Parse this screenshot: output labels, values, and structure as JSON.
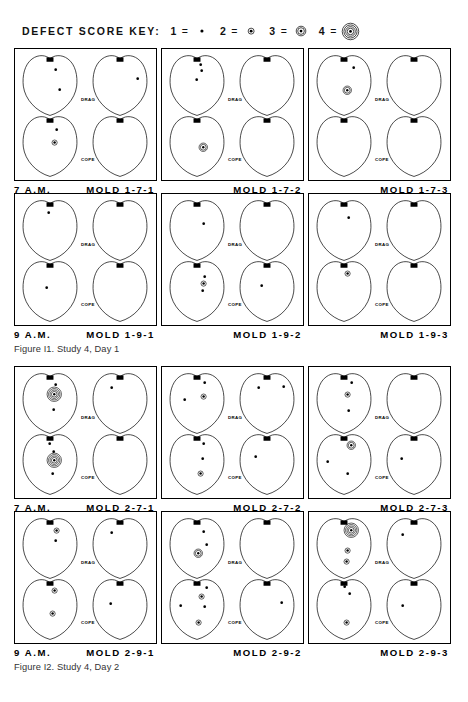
{
  "key": {
    "title": "DEFECT SCORE KEY:",
    "eq": "=",
    "items": [
      {
        "score": "1",
        "mark": 1,
        "name": "score-1-dot"
      },
      {
        "score": "2",
        "mark": 2,
        "name": "score-2-ring"
      },
      {
        "score": "3",
        "mark": 3,
        "name": "score-3-ring"
      },
      {
        "score": "4",
        "mark": 4,
        "name": "score-4-ring"
      }
    ]
  },
  "labels": {
    "drag": "DRAG",
    "cope": "COPE"
  },
  "figures": [
    {
      "caption": "Figure I1.  Study 4, Day 1",
      "rows": [
        {
          "time": "7 A.M.",
          "panels": [
            {
              "label": "MOLD 1-7-1",
              "cells": [
                {
                  "pos": "drag-left",
                  "marks": [
                    {
                      "x": 0.6,
                      "y": 0.26,
                      "s": 1
                    },
                    {
                      "x": 0.66,
                      "y": 0.57,
                      "s": 1
                    }
                  ]
                },
                {
                  "pos": "drag-right",
                  "marks": [
                    {
                      "x": 0.8,
                      "y": 0.4,
                      "s": 1
                    }
                  ]
                },
                {
                  "pos": "cope-left",
                  "marks": [
                    {
                      "x": 0.62,
                      "y": 0.24,
                      "s": 1
                    },
                    {
                      "x": 0.58,
                      "y": 0.45,
                      "s": 2
                    }
                  ]
                },
                {
                  "pos": "cope-right",
                  "marks": []
                }
              ]
            },
            {
              "label": "MOLD 1-7-2",
              "cells": [
                {
                  "pos": "drag-left",
                  "marks": [
                    {
                      "x": 0.56,
                      "y": 0.17,
                      "s": 1
                    },
                    {
                      "x": 0.58,
                      "y": 0.27,
                      "s": 1
                    },
                    {
                      "x": 0.5,
                      "y": 0.42,
                      "s": 1
                    }
                  ]
                },
                {
                  "pos": "drag-right",
                  "marks": []
                },
                {
                  "pos": "cope-left",
                  "marks": [
                    {
                      "x": 0.6,
                      "y": 0.52,
                      "s": 3
                    }
                  ]
                },
                {
                  "pos": "cope-right",
                  "marks": []
                }
              ]
            },
            {
              "label": "MOLD 1-7-3",
              "cells": [
                {
                  "pos": "drag-left",
                  "marks": [
                    {
                      "x": 0.66,
                      "y": 0.22,
                      "s": 1
                    },
                    {
                      "x": 0.56,
                      "y": 0.58,
                      "s": 3
                    }
                  ]
                },
                {
                  "pos": "drag-right",
                  "marks": []
                },
                {
                  "pos": "cope-left",
                  "marks": []
                },
                {
                  "pos": "cope-right",
                  "marks": []
                }
              ]
            }
          ]
        },
        {
          "time": "9 A.M.",
          "panels": [
            {
              "label": "MOLD 1-9-1",
              "cells": [
                {
                  "pos": "drag-left",
                  "marks": [
                    {
                      "x": 0.48,
                      "y": 0.22,
                      "s": 1
                    }
                  ]
                },
                {
                  "pos": "drag-right",
                  "marks": []
                },
                {
                  "pos": "cope-left",
                  "marks": [
                    {
                      "x": 0.44,
                      "y": 0.44,
                      "s": 1
                    }
                  ]
                },
                {
                  "pos": "cope-right",
                  "marks": []
                }
              ]
            },
            {
              "label": "MOLD 1-9-2",
              "cells": [
                {
                  "pos": "drag-left",
                  "marks": [
                    {
                      "x": 0.62,
                      "y": 0.4,
                      "s": 1
                    }
                  ]
                },
                {
                  "pos": "drag-right",
                  "marks": []
                },
                {
                  "pos": "cope-left",
                  "marks": [
                    {
                      "x": 0.64,
                      "y": 0.27,
                      "s": 1
                    },
                    {
                      "x": 0.62,
                      "y": 0.38,
                      "s": 2
                    },
                    {
                      "x": 0.6,
                      "y": 0.5,
                      "s": 1
                    }
                  ]
                },
                {
                  "pos": "cope-right",
                  "marks": [
                    {
                      "x": 0.4,
                      "y": 0.42,
                      "s": 1
                    }
                  ]
                }
              ]
            },
            {
              "label": "MOLD 1-9-3",
              "cells": [
                {
                  "pos": "drag-left",
                  "marks": [
                    {
                      "x": 0.58,
                      "y": 0.3,
                      "s": 1
                    }
                  ]
                },
                {
                  "pos": "drag-right",
                  "marks": []
                },
                {
                  "pos": "cope-left",
                  "marks": [
                    {
                      "x": 0.56,
                      "y": 0.22,
                      "s": 2
                    }
                  ]
                },
                {
                  "pos": "cope-right",
                  "marks": []
                }
              ]
            }
          ]
        }
      ]
    },
    {
      "caption": "Figure I2.  Study 4, Day 2",
      "rows": [
        {
          "time": "7 A.M.",
          "panels": [
            {
              "label": "MOLD 2-7-1",
              "cells": [
                {
                  "pos": "drag-left",
                  "marks": [
                    {
                      "x": 0.6,
                      "y": 0.2,
                      "s": 1
                    },
                    {
                      "x": 0.58,
                      "y": 0.36,
                      "s": 4
                    },
                    {
                      "x": 0.56,
                      "y": 0.6,
                      "s": 1
                    }
                  ]
                },
                {
                  "pos": "drag-right",
                  "marks": [
                    {
                      "x": 0.36,
                      "y": 0.26,
                      "s": 1
                    }
                  ]
                },
                {
                  "pos": "cope-left",
                  "marks": [
                    {
                      "x": 0.5,
                      "y": 0.18,
                      "s": 1
                    },
                    {
                      "x": 0.56,
                      "y": 0.3,
                      "s": 1
                    },
                    {
                      "x": 0.58,
                      "y": 0.44,
                      "s": 4
                    },
                    {
                      "x": 0.54,
                      "y": 0.66,
                      "s": 1
                    }
                  ]
                },
                {
                  "pos": "cope-right",
                  "marks": []
                }
              ]
            },
            {
              "label": "MOLD 2-7-2",
              "cells": [
                {
                  "pos": "drag-left",
                  "marks": [
                    {
                      "x": 0.64,
                      "y": 0.18,
                      "s": 1
                    },
                    {
                      "x": 0.28,
                      "y": 0.44,
                      "s": 1
                    },
                    {
                      "x": 0.62,
                      "y": 0.4,
                      "s": 2
                    }
                  ]
                },
                {
                  "pos": "drag-right",
                  "marks": [
                    {
                      "x": 0.36,
                      "y": 0.26,
                      "s": 1
                    },
                    {
                      "x": 0.78,
                      "y": 0.24,
                      "s": 1
                    }
                  ]
                },
                {
                  "pos": "cope-left",
                  "marks": [
                    {
                      "x": 0.62,
                      "y": 0.18,
                      "s": 1
                    },
                    {
                      "x": 0.6,
                      "y": 0.42,
                      "s": 1
                    },
                    {
                      "x": 0.56,
                      "y": 0.66,
                      "s": 2
                    }
                  ]
                },
                {
                  "pos": "cope-right",
                  "marks": [
                    {
                      "x": 0.3,
                      "y": 0.38,
                      "s": 1
                    }
                  ]
                }
              ]
            },
            {
              "label": "MOLD 2-7-3",
              "cells": [
                {
                  "pos": "drag-left",
                  "marks": [
                    {
                      "x": 0.64,
                      "y": 0.18,
                      "s": 1
                    },
                    {
                      "x": 0.56,
                      "y": 0.36,
                      "s": 2
                    },
                    {
                      "x": 0.58,
                      "y": 0.62,
                      "s": 1
                    }
                  ]
                },
                {
                  "pos": "drag-right",
                  "marks": []
                },
                {
                  "pos": "cope-left",
                  "marks": [
                    {
                      "x": 0.62,
                      "y": 0.2,
                      "s": 3
                    },
                    {
                      "x": 0.22,
                      "y": 0.46,
                      "s": 1
                    },
                    {
                      "x": 0.56,
                      "y": 0.66,
                      "s": 1
                    }
                  ]
                },
                {
                  "pos": "cope-right",
                  "marks": [
                    {
                      "x": 0.28,
                      "y": 0.42,
                      "s": 1
                    }
                  ]
                }
              ]
            }
          ]
        },
        {
          "time": "9 A.M.",
          "panels": [
            {
              "label": "MOLD 2-9-1",
              "cells": [
                {
                  "pos": "drag-left",
                  "marks": [
                    {
                      "x": 0.62,
                      "y": 0.22,
                      "s": 2
                    },
                    {
                      "x": 0.6,
                      "y": 0.38,
                      "s": 1
                    }
                  ]
                },
                {
                  "pos": "drag-right",
                  "marks": [
                    {
                      "x": 0.36,
                      "y": 0.26,
                      "s": 1
                    }
                  ]
                },
                {
                  "pos": "cope-left",
                  "marks": [
                    {
                      "x": 0.58,
                      "y": 0.2,
                      "s": 2
                    },
                    {
                      "x": 0.54,
                      "y": 0.58,
                      "s": 2
                    }
                  ]
                },
                {
                  "pos": "cope-right",
                  "marks": [
                    {
                      "x": 0.34,
                      "y": 0.42,
                      "s": 1
                    }
                  ]
                }
              ]
            },
            {
              "label": "MOLD 2-9-2",
              "cells": [
                {
                  "pos": "drag-left",
                  "marks": [
                    {
                      "x": 0.62,
                      "y": 0.24,
                      "s": 1
                    },
                    {
                      "x": 0.66,
                      "y": 0.44,
                      "s": 1
                    },
                    {
                      "x": 0.52,
                      "y": 0.58,
                      "s": 3
                    }
                  ]
                },
                {
                  "pos": "drag-right",
                  "marks": []
                },
                {
                  "pos": "cope-left",
                  "marks": [
                    {
                      "x": 0.66,
                      "y": 0.16,
                      "s": 1
                    },
                    {
                      "x": 0.58,
                      "y": 0.3,
                      "s": 2
                    },
                    {
                      "x": 0.22,
                      "y": 0.44,
                      "s": 1
                    },
                    {
                      "x": 0.64,
                      "y": 0.46,
                      "s": 1
                    },
                    {
                      "x": 0.52,
                      "y": 0.72,
                      "s": 2
                    }
                  ]
                },
                {
                  "pos": "cope-right",
                  "marks": [
                    {
                      "x": 0.76,
                      "y": 0.4,
                      "s": 1
                    }
                  ]
                }
              ]
            },
            {
              "label": "MOLD 2-9-3",
              "cells": [
                {
                  "pos": "drag-left",
                  "marks": [
                    {
                      "x": 0.62,
                      "y": 0.22,
                      "s": 4
                    },
                    {
                      "x": 0.56,
                      "y": 0.54,
                      "s": 2
                    },
                    {
                      "x": 0.54,
                      "y": 0.72,
                      "s": 2
                    }
                  ]
                },
                {
                  "pos": "drag-right",
                  "marks": [
                    {
                      "x": 0.3,
                      "y": 0.28,
                      "s": 1
                    }
                  ]
                },
                {
                  "pos": "cope-left",
                  "marks": [
                    {
                      "x": 0.52,
                      "y": 0.14,
                      "s": 1
                    },
                    {
                      "x": 0.6,
                      "y": 0.26,
                      "s": 1
                    },
                    {
                      "x": 0.54,
                      "y": 0.72,
                      "s": 2
                    }
                  ]
                },
                {
                  "pos": "cope-right",
                  "marks": [
                    {
                      "x": 0.3,
                      "y": 0.44,
                      "s": 1
                    }
                  ]
                }
              ]
            }
          ]
        }
      ]
    }
  ]
}
